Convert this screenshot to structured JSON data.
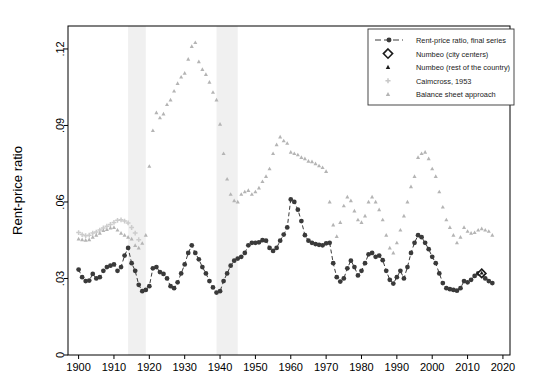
{
  "figure": {
    "background": "#ffffff",
    "plot_frame": {
      "x": 68,
      "y": 26,
      "width": 442,
      "height": 329
    },
    "axis_color": "#000000"
  },
  "axes": {
    "ylabel": "Rent-price ratio",
    "xlabel": "",
    "y_ticks": [
      "0",
      ".03",
      ".06",
      ".09",
      ".12"
    ],
    "y_tick_values": [
      0,
      0.03,
      0.06,
      0.09,
      0.12
    ],
    "x_ticks": [
      "1900",
      "1910",
      "1920",
      "1930",
      "1940",
      "1950",
      "1960",
      "1970",
      "1980",
      "1990",
      "2000",
      "2010",
      "2020"
    ],
    "x_tick_values": [
      1900,
      1910,
      1920,
      1930,
      1940,
      1950,
      1960,
      1970,
      1980,
      1990,
      2000,
      2010,
      2020
    ],
    "xlim": [
      1897,
      2022
    ],
    "ylim": [
      0,
      0.129
    ],
    "grid": false
  },
  "legend": {
    "position": "top-right",
    "border_color": "#333333",
    "entries": [
      {
        "label": "Rent-price ratio, final series",
        "marker": "circle-line",
        "color": "#3a3a3a"
      },
      {
        "label": "Numbeo (city centers)",
        "marker": "diamond",
        "color": "#1a1a1a"
      },
      {
        "label": "Numbeo (rest of the country)",
        "marker": "triangle",
        "color": "#1a1a1a"
      },
      {
        "label": "Caimcross, 1953",
        "marker": "plus",
        "color": "#c8c8c8"
      },
      {
        "label": "Balance sheet approach",
        "marker": "triangle",
        "color": "#b4b4b4"
      }
    ]
  },
  "shaded_bands": {
    "color": "#f0f0f0",
    "label": "war periods",
    "ranges": [
      [
        1914,
        1919
      ],
      [
        1939,
        1945
      ]
    ]
  },
  "chart_data": {
    "type": "scatter",
    "title": "",
    "xlabel": "",
    "ylabel": "Rent-price ratio",
    "xlim": [
      1897,
      2022
    ],
    "ylim": [
      0,
      0.129
    ],
    "grid": false,
    "legend_position": "top-right",
    "series": [
      {
        "name": "Rent-price ratio, final series",
        "marker": "circle",
        "color": "#3a3a3a",
        "line": "dashed",
        "points": [
          [
            1900,
            0.0335
          ],
          [
            1901,
            0.0305
          ],
          [
            1902,
            0.029
          ],
          [
            1903,
            0.0292
          ],
          [
            1904,
            0.0318
          ],
          [
            1905,
            0.03
          ],
          [
            1906,
            0.0305
          ],
          [
            1907,
            0.033
          ],
          [
            1908,
            0.0345
          ],
          [
            1909,
            0.035
          ],
          [
            1910,
            0.0355
          ],
          [
            1911,
            0.033
          ],
          [
            1912,
            0.0345
          ],
          [
            1913,
            0.039
          ],
          [
            1914,
            0.042
          ],
          [
            1915,
            0.036
          ],
          [
            1916,
            0.033
          ],
          [
            1917,
            0.0275
          ],
          [
            1918,
            0.025
          ],
          [
            1919,
            0.0255
          ],
          [
            1920,
            0.027
          ],
          [
            1921,
            0.034
          ],
          [
            1922,
            0.0345
          ],
          [
            1923,
            0.0325
          ],
          [
            1924,
            0.0318
          ],
          [
            1925,
            0.03
          ],
          [
            1926,
            0.027
          ],
          [
            1927,
            0.0262
          ],
          [
            1928,
            0.0285
          ],
          [
            1929,
            0.032
          ],
          [
            1930,
            0.0355
          ],
          [
            1931,
            0.04
          ],
          [
            1932,
            0.043
          ],
          [
            1933,
            0.04
          ],
          [
            1934,
            0.0375
          ],
          [
            1935,
            0.0345
          ],
          [
            1936,
            0.032
          ],
          [
            1937,
            0.029
          ],
          [
            1938,
            0.0265
          ],
          [
            1939,
            0.0245
          ],
          [
            1940,
            0.025
          ],
          [
            1941,
            0.029
          ],
          [
            1942,
            0.032
          ],
          [
            1943,
            0.035
          ],
          [
            1944,
            0.037
          ],
          [
            1945,
            0.0378
          ],
          [
            1946,
            0.0385
          ],
          [
            1947,
            0.04
          ],
          [
            1948,
            0.043
          ],
          [
            1949,
            0.044
          ],
          [
            1950,
            0.044
          ],
          [
            1951,
            0.0442
          ],
          [
            1952,
            0.045
          ],
          [
            1953,
            0.0448
          ],
          [
            1954,
            0.042
          ],
          [
            1955,
            0.0408
          ],
          [
            1956,
            0.042
          ],
          [
            1957,
            0.0448
          ],
          [
            1958,
            0.0472
          ],
          [
            1959,
            0.05
          ],
          [
            1960,
            0.061
          ],
          [
            1961,
            0.06
          ],
          [
            1962,
            0.057
          ],
          [
            1963,
            0.0525
          ],
          [
            1964,
            0.047
          ],
          [
            1965,
            0.0448
          ],
          [
            1966,
            0.044
          ],
          [
            1967,
            0.0435
          ],
          [
            1968,
            0.0432
          ],
          [
            1969,
            0.043
          ],
          [
            1970,
            0.0438
          ],
          [
            1971,
            0.044
          ],
          [
            1972,
            0.036
          ],
          [
            1973,
            0.0305
          ],
          [
            1974,
            0.0288
          ],
          [
            1975,
            0.03
          ],
          [
            1976,
            0.034
          ],
          [
            1977,
            0.037
          ],
          [
            1978,
            0.0345
          ],
          [
            1979,
            0.0312
          ],
          [
            1980,
            0.033
          ],
          [
            1981,
            0.036
          ],
          [
            1982,
            0.0395
          ],
          [
            1983,
            0.04
          ],
          [
            1984,
            0.0385
          ],
          [
            1985,
            0.039
          ],
          [
            1986,
            0.0372
          ],
          [
            1987,
            0.033
          ],
          [
            1988,
            0.0295
          ],
          [
            1989,
            0.028
          ],
          [
            1990,
            0.0305
          ],
          [
            1991,
            0.033
          ],
          [
            1992,
            0.03
          ],
          [
            1993,
            0.0345
          ],
          [
            1994,
            0.04
          ],
          [
            1995,
            0.044
          ],
          [
            1996,
            0.047
          ],
          [
            1997,
            0.0462
          ],
          [
            1998,
            0.044
          ],
          [
            1999,
            0.0415
          ],
          [
            2000,
            0.0385
          ],
          [
            2001,
            0.036
          ],
          [
            2002,
            0.032
          ],
          [
            2003,
            0.0282
          ],
          [
            2004,
            0.0262
          ],
          [
            2005,
            0.0258
          ],
          [
            2006,
            0.0255
          ],
          [
            2007,
            0.0252
          ],
          [
            2008,
            0.0262
          ],
          [
            2009,
            0.029
          ],
          [
            2010,
            0.0285
          ],
          [
            2011,
            0.0295
          ],
          [
            2012,
            0.031
          ],
          [
            2013,
            0.032
          ],
          [
            2014,
            0.0318
          ],
          [
            2015,
            0.03
          ],
          [
            2016,
            0.029
          ],
          [
            2017,
            0.0282
          ]
        ]
      },
      {
        "name": "Numbeo (city centers)",
        "marker": "diamond",
        "color": "#1a1a1a",
        "points": [
          [
            2014,
            0.032
          ]
        ]
      },
      {
        "name": "Numbeo (rest of the country)",
        "marker": "triangle",
        "color": "#1a1a1a",
        "points": [
          [
            2014,
            0.0322
          ]
        ]
      },
      {
        "name": "Caimcross, 1953",
        "marker": "plus",
        "color": "#cccccc",
        "points": [
          [
            1900,
            0.048
          ],
          [
            1901,
            0.0472
          ],
          [
            1902,
            0.0468
          ],
          [
            1903,
            0.047
          ],
          [
            1904,
            0.0478
          ],
          [
            1905,
            0.0482
          ],
          [
            1906,
            0.049
          ],
          [
            1907,
            0.0498
          ],
          [
            1908,
            0.0505
          ],
          [
            1909,
            0.0512
          ],
          [
            1910,
            0.052
          ],
          [
            1911,
            0.0528
          ],
          [
            1912,
            0.053
          ],
          [
            1913,
            0.0525
          ],
          [
            1914,
            0.0518
          ],
          [
            1915,
            0.05
          ],
          [
            1916,
            0.0478
          ],
          [
            1917,
            0.0452
          ]
        ]
      },
      {
        "name": "Balance sheet approach",
        "marker": "triangle",
        "color": "#b4b4b4",
        "points": [
          [
            1900,
            0.0455
          ],
          [
            1901,
            0.0452
          ],
          [
            1902,
            0.045
          ],
          [
            1903,
            0.0452
          ],
          [
            1904,
            0.0462
          ],
          [
            1905,
            0.047
          ],
          [
            1906,
            0.0478
          ],
          [
            1907,
            0.0488
          ],
          [
            1908,
            0.0492
          ],
          [
            1909,
            0.0498
          ],
          [
            1910,
            0.05
          ],
          [
            1911,
            0.049
          ],
          [
            1912,
            0.0478
          ],
          [
            1913,
            0.047
          ],
          [
            1914,
            0.0462
          ],
          [
            1915,
            0.0455
          ],
          [
            1916,
            0.043
          ],
          [
            1917,
            0.042
          ],
          [
            1918,
            0.0438
          ],
          [
            1919,
            0.047
          ],
          [
            1920,
            0.074
          ],
          [
            1921,
            0.088
          ],
          [
            1922,
            0.095
          ],
          [
            1923,
            0.093
          ],
          [
            1924,
            0.0945
          ],
          [
            1925,
            0.0982
          ],
          [
            1926,
            0.1
          ],
          [
            1927,
            0.1035
          ],
          [
            1928,
            0.1065
          ],
          [
            1929,
            0.109
          ],
          [
            1930,
            0.1105
          ],
          [
            1931,
            0.116
          ],
          [
            1932,
            0.121
          ],
          [
            1933,
            0.1225
          ],
          [
            1934,
            0.115
          ],
          [
            1935,
            0.112
          ],
          [
            1936,
            0.11
          ],
          [
            1937,
            0.107
          ],
          [
            1938,
            0.103
          ],
          [
            1939,
            0.1
          ],
          [
            1940,
            0.0905
          ],
          [
            1941,
            0.079
          ],
          [
            1942,
            0.069
          ],
          [
            1943,
            0.063
          ],
          [
            1944,
            0.0605
          ],
          [
            1945,
            0.06
          ],
          [
            1946,
            0.063
          ],
          [
            1947,
            0.064
          ],
          [
            1948,
            0.0645
          ],
          [
            1949,
            0.063
          ],
          [
            1950,
            0.064
          ],
          [
            1951,
            0.0655
          ],
          [
            1952,
            0.068
          ],
          [
            1953,
            0.07
          ],
          [
            1954,
            0.073
          ],
          [
            1955,
            0.079
          ],
          [
            1956,
            0.0825
          ],
          [
            1957,
            0.0855
          ],
          [
            1958,
            0.084
          ],
          [
            1959,
            0.083
          ],
          [
            1960,
            0.0795
          ],
          [
            1961,
            0.079
          ],
          [
            1962,
            0.0785
          ],
          [
            1963,
            0.0775
          ],
          [
            1964,
            0.077
          ],
          [
            1965,
            0.076
          ],
          [
            1966,
            0.0758
          ],
          [
            1967,
            0.075
          ],
          [
            1968,
            0.0742
          ],
          [
            1969,
            0.0735
          ],
          [
            1970,
            0.072
          ],
          [
            1971,
            0.06
          ],
          [
            1972,
            0.051
          ],
          [
            1973,
            0.0465
          ],
          [
            1974,
            0.052
          ],
          [
            1975,
            0.0585
          ],
          [
            1976,
            0.062
          ],
          [
            1977,
            0.0605
          ],
          [
            1978,
            0.0565
          ],
          [
            1979,
            0.053
          ],
          [
            1980,
            0.052
          ],
          [
            1981,
            0.0545
          ],
          [
            1982,
            0.06
          ],
          [
            1983,
            0.062
          ],
          [
            1984,
            0.06
          ],
          [
            1985,
            0.057
          ],
          [
            1986,
            0.053
          ],
          [
            1987,
            0.047
          ],
          [
            1988,
            0.042
          ],
          [
            1989,
            0.04
          ],
          [
            1990,
            0.044
          ],
          [
            1991,
            0.049
          ],
          [
            1992,
            0.0545
          ],
          [
            1993,
            0.06
          ],
          [
            1994,
            0.066
          ],
          [
            1995,
            0.07
          ],
          [
            1996,
            0.0775
          ],
          [
            1997,
            0.079
          ],
          [
            1998,
            0.0795
          ],
          [
            1999,
            0.077
          ],
          [
            2000,
            0.073
          ],
          [
            2001,
            0.07
          ],
          [
            2002,
            0.064
          ],
          [
            2003,
            0.058
          ],
          [
            2004,
            0.053
          ],
          [
            2005,
            0.05
          ],
          [
            2006,
            0.047
          ],
          [
            2007,
            0.044
          ],
          [
            2008,
            0.0462
          ],
          [
            2009,
            0.05
          ],
          [
            2010,
            0.0485
          ],
          [
            2011,
            0.0478
          ],
          [
            2012,
            0.048
          ],
          [
            2013,
            0.049
          ],
          [
            2014,
            0.0495
          ],
          [
            2015,
            0.049
          ],
          [
            2016,
            0.0485
          ],
          [
            2017,
            0.047
          ]
        ]
      }
    ]
  }
}
